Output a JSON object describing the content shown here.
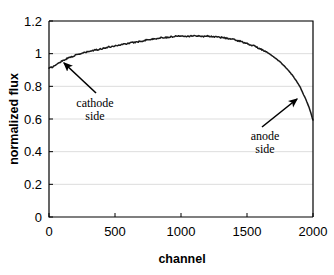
{
  "chart_data": {
    "type": "line",
    "title": "",
    "xlabel": "channel",
    "ylabel": "normalized flux",
    "xlim": [
      0,
      2000
    ],
    "ylim": [
      0,
      1.2
    ],
    "grid": true,
    "legend": "none",
    "xticks": [
      0,
      500,
      1000,
      1500,
      2000
    ],
    "xtick_labels": [
      "0",
      "500",
      "1000",
      "1500",
      "2000"
    ],
    "yticks": [
      0,
      0.2,
      0.4,
      0.6,
      0.8,
      1,
      1.2
    ],
    "ytick_labels": [
      "0",
      "0.2",
      "0.4",
      "0.6",
      "0.8",
      "1",
      "1.2"
    ],
    "series": [
      {
        "name": "normalized flux",
        "color": "#1a1a1a",
        "x": [
          0,
          25,
          50,
          75,
          100,
          125,
          150,
          175,
          200,
          250,
          300,
          350,
          400,
          450,
          500,
          550,
          600,
          650,
          700,
          750,
          800,
          850,
          900,
          950,
          1000,
          1050,
          1100,
          1150,
          1200,
          1250,
          1300,
          1350,
          1400,
          1450,
          1500,
          1550,
          1600,
          1650,
          1700,
          1750,
          1800,
          1850,
          1900,
          1950,
          1975,
          2000
        ],
        "y": [
          0.91,
          0.918,
          0.93,
          0.944,
          0.956,
          0.966,
          0.975,
          0.983,
          0.99,
          1.002,
          1.013,
          1.022,
          1.031,
          1.04,
          1.048,
          1.056,
          1.063,
          1.07,
          1.077,
          1.086,
          1.09,
          1.098,
          1.1,
          1.106,
          1.11,
          1.107,
          1.11,
          1.106,
          1.108,
          1.104,
          1.1,
          1.094,
          1.086,
          1.076,
          1.062,
          1.048,
          1.03,
          1.008,
          0.982,
          0.95,
          0.91,
          0.862,
          0.8,
          0.712,
          0.66,
          0.592
        ]
      }
    ],
    "annotations": [
      {
        "id": "cathode",
        "label_line1": "cathode",
        "label_line2": "side",
        "text_x": 95,
        "text_y": 107,
        "arrow_from_x": 96,
        "arrow_from_y": 93,
        "arrow_to_x": 64,
        "arrow_to_y": 63
      },
      {
        "id": "anode",
        "label_line1": "anode",
        "label_line2": "side",
        "text_x": 265,
        "text_y": 140,
        "arrow_from_x": 262,
        "arrow_from_y": 127,
        "arrow_to_x": 297,
        "arrow_to_y": 99
      }
    ]
  },
  "axes": {
    "x_label": "channel",
    "y_label": "normalized flux"
  }
}
